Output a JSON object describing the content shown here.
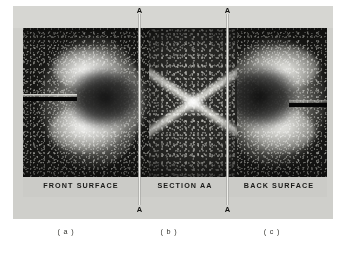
{
  "figure": {
    "type": "three-panel photographic plate",
    "panels": [
      {
        "id": "a",
        "band_label": "FRONT SURFACE",
        "sub_caption": "( a )",
        "description": "bright irregular crater-like damage zone on dark speckled surface with dark horizontal edge mark at left"
      },
      {
        "id": "b",
        "band_label": "SECTION AA",
        "sub_caption": "( b )",
        "description": "cross-sectional view showing an X shaped pair of light diagonal bands on dark speckled matrix"
      },
      {
        "id": "c",
        "band_label": "BACK SURFACE",
        "sub_caption": "( c )",
        "description": "mirrored bright crater-like damage zone with dark horizontal edge mark at right"
      }
    ],
    "section_markers": {
      "letter": "A",
      "top_left": "A",
      "top_right": "A",
      "bottom_left": "A",
      "bottom_right": "A"
    },
    "colors": {
      "page_background": "#ffffff",
      "plate_background": "#cfcfcb",
      "top_band": "#d6d6d2",
      "label_band": "#cbcbc7",
      "photo_dark": "#161614",
      "photo_mid": "#2b2b28",
      "section_line": "#e3e3df",
      "label_text": "#1a1a18",
      "caption_text": "#34342f"
    }
  }
}
